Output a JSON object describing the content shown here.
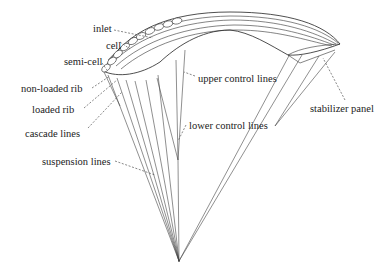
{
  "diagram": {
    "labels": {
      "inlet": "inlet",
      "cell": "cell",
      "semi_cell": "semi-cell",
      "non_loaded_rib": "non-loaded rib",
      "loaded_rib": "loaded rib",
      "cascade_lines": "cascade lines",
      "suspension_lines": "suspension lines",
      "upper_control_lines": "upper control lines",
      "lower_control_lines": "lower control lines",
      "stabilizer_panel": "stabilizer panel"
    }
  }
}
